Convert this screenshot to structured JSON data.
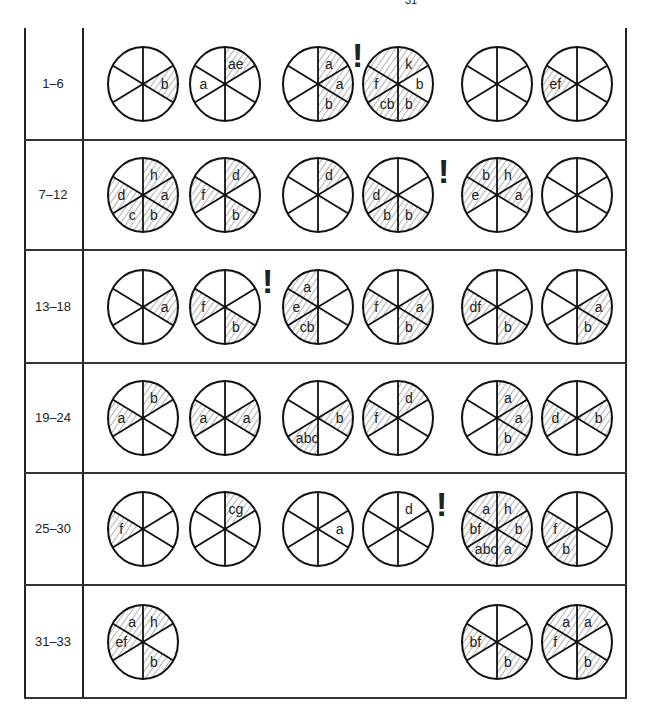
{
  "page_number": "31",
  "sector_order": [
    "TR",
    "R",
    "BR",
    "BL",
    "L",
    "TL"
  ],
  "rows": [
    {
      "label": "1–6",
      "circles": [
        {
          "slot": 1,
          "sectors": {
            "R": {
              "hatched": true,
              "text": "b"
            }
          }
        },
        {
          "slot": 2,
          "sectors": {
            "TR": {
              "hatched": true,
              "text": "ae"
            },
            "L": {
              "hatched": false,
              "text": "a"
            }
          }
        },
        {
          "slot": 3,
          "sectors": {
            "TR": {
              "hatched": true,
              "text": "a"
            },
            "R": {
              "hatched": true,
              "text": "a"
            },
            "BR": {
              "hatched": true,
              "text": "b"
            }
          }
        },
        {
          "slot": 4,
          "sectors": {
            "TR": {
              "hatched": true,
              "text": "k"
            },
            "R": {
              "hatched": false,
              "text": "b"
            },
            "BR": {
              "hatched": true,
              "text": "b"
            },
            "BL": {
              "hatched": true,
              "text": "cb"
            },
            "L": {
              "hatched": true,
              "text": "f"
            },
            "TL": {
              "hatched": true,
              "text": ""
            }
          }
        },
        {
          "slot": 5,
          "sectors": {}
        },
        {
          "slot": 6,
          "sectors": {
            "L": {
              "hatched": true,
              "text": "ef"
            }
          }
        }
      ],
      "marks": [
        {
          "x": 352,
          "y": 10
        }
      ]
    },
    {
      "label": "7–12",
      "circles": [
        {
          "slot": 1,
          "sectors": {
            "TR": {
              "hatched": true,
              "text": "h"
            },
            "R": {
              "hatched": true,
              "text": "a"
            },
            "BR": {
              "hatched": true,
              "text": "b"
            },
            "BL": {
              "hatched": true,
              "text": "c"
            },
            "L": {
              "hatched": true,
              "text": "d"
            }
          }
        },
        {
          "slot": 2,
          "sectors": {
            "TR": {
              "hatched": true,
              "text": "d"
            },
            "BR": {
              "hatched": true,
              "text": "b"
            },
            "L": {
              "hatched": true,
              "text": "f"
            }
          }
        },
        {
          "slot": 3,
          "sectors": {
            "TR": {
              "hatched": true,
              "text": "d"
            }
          }
        },
        {
          "slot": 4,
          "sectors": {
            "BR": {
              "hatched": true,
              "text": "b"
            },
            "BL": {
              "hatched": true,
              "text": "b"
            },
            "L": {
              "hatched": true,
              "text": "d"
            }
          }
        },
        {
          "slot": 5,
          "sectors": {
            "TL": {
              "hatched": true,
              "text": "b"
            },
            "TR": {
              "hatched": true,
              "text": "h"
            },
            "R": {
              "hatched": true,
              "text": "a"
            },
            "L": {
              "hatched": true,
              "text": "e"
            }
          }
        },
        {
          "slot": 6,
          "sectors": {}
        }
      ],
      "marks": [
        {
          "x": 438,
          "y": 14
        }
      ]
    },
    {
      "label": "13–18",
      "circles": [
        {
          "slot": 1,
          "sectors": {
            "R": {
              "hatched": true,
              "text": "a"
            }
          }
        },
        {
          "slot": 2,
          "sectors": {
            "L": {
              "hatched": true,
              "text": "f"
            },
            "BR": {
              "hatched": true,
              "text": "b"
            }
          }
        },
        {
          "slot": 3,
          "sectors": {
            "TL": {
              "hatched": true,
              "text": "a"
            },
            "L": {
              "hatched": true,
              "text": "e"
            },
            "BL": {
              "hatched": true,
              "text": "cb"
            }
          }
        },
        {
          "slot": 4,
          "sectors": {
            "L": {
              "hatched": true,
              "text": "f"
            },
            "R": {
              "hatched": true,
              "text": "a"
            },
            "BR": {
              "hatched": true,
              "text": "b"
            }
          }
        },
        {
          "slot": 5,
          "sectors": {
            "L": {
              "hatched": true,
              "text": "df"
            },
            "BR": {
              "hatched": true,
              "text": "b"
            }
          }
        },
        {
          "slot": 6,
          "sectors": {
            "R": {
              "hatched": true,
              "text": "a"
            },
            "BR": {
              "hatched": true,
              "text": "b"
            }
          }
        }
      ],
      "marks": [
        {
          "x": 262,
          "y": 14
        }
      ]
    },
    {
      "label": "19–24",
      "circles": [
        {
          "slot": 1,
          "sectors": {
            "TR": {
              "hatched": true,
              "text": "b"
            },
            "L": {
              "hatched": true,
              "text": "a"
            }
          }
        },
        {
          "slot": 2,
          "sectors": {
            "L": {
              "hatched": true,
              "text": "a"
            },
            "R": {
              "hatched": true,
              "text": "a"
            }
          }
        },
        {
          "slot": 3,
          "sectors": {
            "R": {
              "hatched": true,
              "text": "b"
            },
            "BL": {
              "hatched": true,
              "text": "abc"
            }
          }
        },
        {
          "slot": 4,
          "sectors": {
            "TR": {
              "hatched": true,
              "text": "d"
            },
            "L": {
              "hatched": true,
              "text": "f"
            }
          }
        },
        {
          "slot": 5,
          "sectors": {
            "TR": {
              "hatched": true,
              "text": "a"
            },
            "R": {
              "hatched": true,
              "text": "a"
            },
            "BR": {
              "hatched": true,
              "text": "b"
            }
          }
        },
        {
          "slot": 6,
          "sectors": {
            "L": {
              "hatched": true,
              "text": "d"
            },
            "R": {
              "hatched": true,
              "text": "b"
            }
          }
        }
      ],
      "marks": []
    },
    {
      "label": "25–30",
      "circles": [
        {
          "slot": 1,
          "sectors": {
            "L": {
              "hatched": true,
              "text": "f"
            }
          }
        },
        {
          "slot": 2,
          "sectors": {
            "TR": {
              "hatched": true,
              "text": "cg"
            }
          }
        },
        {
          "slot": 3,
          "sectors": {
            "R": {
              "hatched": false,
              "text": "a"
            }
          }
        },
        {
          "slot": 4,
          "sectors": {
            "TR": {
              "hatched": false,
              "text": "d"
            }
          }
        },
        {
          "slot": 5,
          "sectors": {
            "TL": {
              "hatched": true,
              "text": "a"
            },
            "TR": {
              "hatched": true,
              "text": "h"
            },
            "R": {
              "hatched": true,
              "text": "b"
            },
            "BR": {
              "hatched": true,
              "text": "a"
            },
            "BL": {
              "hatched": true,
              "text": "abc"
            },
            "L": {
              "hatched": true,
              "text": "bf"
            }
          }
        },
        {
          "slot": 6,
          "sectors": {
            "L": {
              "hatched": true,
              "text": "f"
            },
            "BL": {
              "hatched": true,
              "text": "b"
            }
          }
        }
      ],
      "marks": [
        {
          "x": 436,
          "y": 14
        }
      ]
    },
    {
      "label": "31–33",
      "circles": [
        {
          "slot": 1,
          "sectors": {
            "TL": {
              "hatched": true,
              "text": "a"
            },
            "TR": {
              "hatched": true,
              "text": "h"
            },
            "L": {
              "hatched": true,
              "text": "ef"
            },
            "BR": {
              "hatched": true,
              "text": "b"
            }
          }
        },
        {
          "slot": 5,
          "sectors": {
            "L": {
              "hatched": true,
              "text": "bf"
            },
            "BR": {
              "hatched": true,
              "text": "b"
            }
          }
        },
        {
          "slot": 6,
          "sectors": {
            "TL": {
              "hatched": true,
              "text": "a"
            },
            "TR": {
              "hatched": true,
              "text": "a"
            },
            "L": {
              "hatched": true,
              "text": "f"
            },
            "BR": {
              "hatched": true,
              "text": "b"
            }
          }
        }
      ],
      "marks": []
    }
  ],
  "mark_symbol": "!"
}
